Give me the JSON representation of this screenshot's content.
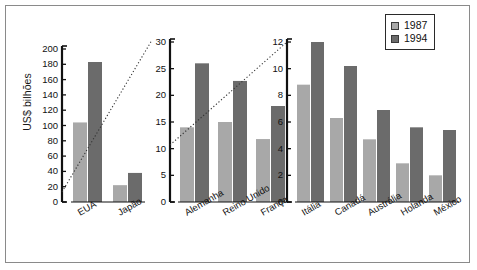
{
  "figure": {
    "ylabel": "US$ bilhões",
    "border_color": "#8a8a8a",
    "background": "#ffffff"
  },
  "legend": {
    "position": "top-right",
    "entries": [
      {
        "label": "1987",
        "color": "#a8a8a8"
      },
      {
        "label": "1994",
        "color": "#6b6b6b"
      }
    ]
  },
  "chart_data": {
    "type": "bar",
    "title": "",
    "xlabel": "",
    "ylabel": "US$ bilhões",
    "grid": false,
    "legend_position": "top-right",
    "note": "Three panels side by side, each with its own y-axis scale; dotted diagonal lines link the scale breaks.",
    "categories": [
      "EUA",
      "Japão",
      "Alemanha",
      "Reino Unido",
      "França",
      "Itália",
      "Canadá",
      "Austrália",
      "Holanda",
      "México"
    ],
    "series": [
      {
        "name": "1987",
        "color": "#a8a8a8",
        "values": [
          104,
          22,
          14,
          15,
          11.8,
          8.8,
          6.3,
          4.7,
          2.9,
          2.0
        ]
      },
      {
        "name": "1994",
        "color": "#6b6b6b",
        "values": [
          183,
          38,
          26,
          22.7,
          18,
          12,
          10.2,
          6.9,
          5.6,
          5.4
        ]
      }
    ],
    "panels": [
      {
        "name": "panel-1",
        "ylim": [
          0,
          200
        ],
        "yticks": [
          0,
          20,
          40,
          60,
          80,
          100,
          120,
          140,
          160,
          180,
          200
        ],
        "categories": [
          "EUA",
          "Japão"
        ],
        "series": [
          {
            "name": "1987",
            "values": [
              104,
              22
            ]
          },
          {
            "name": "1994",
            "values": [
              183,
              38
            ]
          }
        ]
      },
      {
        "name": "panel-2",
        "ylim": [
          0,
          30
        ],
        "yticks": [
          0,
          5,
          10,
          15,
          20,
          25,
          30
        ],
        "categories": [
          "Alemanha",
          "Reino Unido",
          "França"
        ],
        "series": [
          {
            "name": "1987",
            "values": [
              14,
              15,
              11.8
            ]
          },
          {
            "name": "1994",
            "values": [
              26,
              22.7,
              18
            ]
          }
        ]
      },
      {
        "name": "panel-3",
        "ylim": [
          0,
          12
        ],
        "yticks": [
          0,
          2,
          4,
          6,
          8,
          10,
          12
        ],
        "categories": [
          "Itália",
          "Canadá",
          "Austrália",
          "Holanda",
          "México"
        ],
        "series": [
          {
            "name": "1987",
            "values": [
              8.8,
              6.3,
              4.7,
              2.9,
              2.0
            ]
          },
          {
            "name": "1994",
            "values": [
              12,
              10.2,
              6.9,
              5.6,
              5.4
            ]
          }
        ]
      }
    ]
  }
}
